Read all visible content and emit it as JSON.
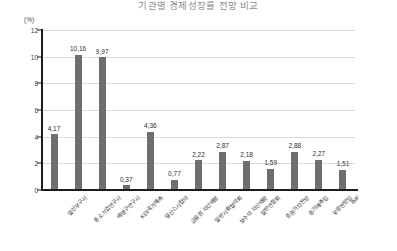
{
  "chart_data": {
    "type": "bar",
    "title": "기관별 경제성장률 전망 비교",
    "ylabel": "(%)",
    "xlabel": "",
    "ylim": [
      0,
      12
    ],
    "ytick_labels": [
      "0",
      "2",
      "4",
      "6",
      "8",
      "10",
      "12"
    ],
    "ytick_values": [
      0,
      2,
      4,
      6,
      8,
      10,
      12
    ],
    "grid": true,
    "legend": "none",
    "bar_color": "#6e6e6e",
    "categories": [
      "일산부구시",
      "중소기업연구시",
      "배명구연구시",
      "KDI국가예측",
      "일산스사협의",
      "금융권 자산배분",
      "일반사회협의회",
      "보수의 자산배분",
      "일반연합회",
      "증권가치전망",
      "중기예측팀",
      "우량전망팀",
      "IMF"
    ],
    "values": [
      4.17,
      10.16,
      9.97,
      0.37,
      4.36,
      0.77,
      2.22,
      2.87,
      2.18,
      1.59,
      2.88,
      2.27,
      1.51
    ],
    "value_labels": [
      "4,17",
      "10,16",
      "9,97",
      "0,37",
      "4,36",
      "0,77",
      "2,22",
      "2,87",
      "2,18",
      "1,59",
      "2,88",
      "2,27",
      "1,51"
    ]
  }
}
